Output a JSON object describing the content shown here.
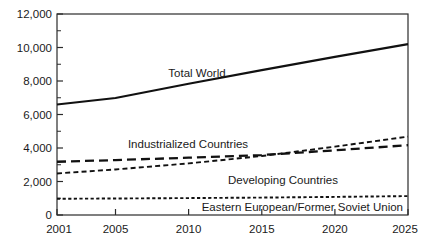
{
  "chart_data": {
    "type": "line",
    "title": "",
    "subtitle": "",
    "xlabel": "",
    "ylabel": "",
    "xlim": [
      2001,
      2025
    ],
    "ylim": [
      0,
      12000
    ],
    "grid": false,
    "legend_position": "inline-annotations",
    "x_tick_labels": [
      "2001",
      "2005",
      "2010",
      "2015",
      "2020",
      "2025"
    ],
    "x_ticks": [
      2001,
      2005,
      2010,
      2015,
      2020,
      2025
    ],
    "y_tick_labels": [
      "0",
      "2,000",
      "4,000",
      "6,000",
      "8,000",
      "10,000",
      "12,000"
    ],
    "y_ticks": [
      0,
      2000,
      4000,
      6000,
      8000,
      10000,
      12000
    ],
    "y_minor_ticks": [
      1000,
      3000,
      5000,
      7000,
      9000,
      11000
    ],
    "series": [
      {
        "name": "Total World",
        "style": "solid",
        "annotation": "Total World",
        "x": [
          2001,
          2005,
          2010,
          2015,
          2020,
          2025
        ],
        "values": [
          6600,
          6980,
          7840,
          8650,
          9440,
          10200
        ]
      },
      {
        "name": "Industrialized Countries",
        "style": "long-dash",
        "annotation": "Industrialized Countries",
        "x": [
          2001,
          2005,
          2010,
          2015,
          2020,
          2025
        ],
        "values": [
          3180,
          3280,
          3420,
          3580,
          3860,
          4170
        ]
      },
      {
        "name": "Developing Countries",
        "style": "short-dash",
        "annotation": "Developing Countries",
        "x": [
          2001,
          2005,
          2010,
          2015,
          2020,
          2025
        ],
        "values": [
          2480,
          2720,
          3080,
          3520,
          4080,
          4680
        ]
      },
      {
        "name": "Eastern European/Former Soviet Union",
        "style": "dotted",
        "annotation": "Eastern European/Former Soviet Union",
        "x": [
          2001,
          2005,
          2010,
          2015,
          2020,
          2025
        ],
        "values": [
          970,
          985,
          1010,
          1040,
          1080,
          1130
        ]
      }
    ],
    "annotations": [
      {
        "text": "Total World",
        "x": 2009.6,
        "y": 8600
      },
      {
        "text": "Industrialized Countries",
        "x": 2008.0,
        "y": 4250
      },
      {
        "text": "Developing Countries",
        "x": 2016.0,
        "y": 2320
      },
      {
        "text": "Eastern European/Former Soviet Union",
        "x": 2022.6,
        "y": 420
      }
    ]
  }
}
